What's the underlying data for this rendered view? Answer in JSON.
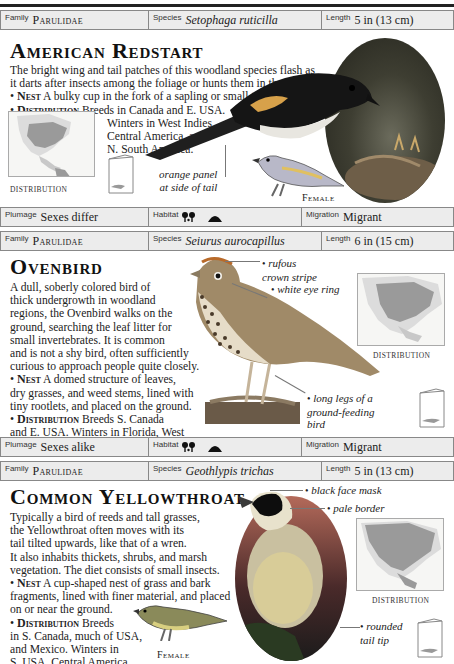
{
  "page": {
    "top_rule": true
  },
  "entries": [
    {
      "id": "american-redstart",
      "info_bar": {
        "family_label": "Family",
        "family": "Parulidae",
        "species_label": "Species",
        "species": "Setophaga ruticilla",
        "length_label": "Length",
        "length": "5 in (13 cm)"
      },
      "title": "American Redstart",
      "description": "The bright wing and tail patches of this woodland species flash as it darts after insects among the foliage or hunts them in the air.",
      "nest_label": "Nest",
      "nest": "A bulky cup in the fork of a sapling or small tree.",
      "distribution_label": "Distribution",
      "distribution": "Breeds in Canada and E. USA.",
      "distribution_cont": [
        "Winters in West Indies,",
        "Central America, and",
        "N. South America."
      ],
      "map_caption": "DISTRIBUTION",
      "callouts": [
        "orange panel at side of tail"
      ],
      "callout_lines": [
        "orange panel",
        "at side of tail"
      ],
      "female_label": "Female",
      "status_bar": {
        "plumage_label": "Plumage",
        "plumage": "Sexes differ",
        "habitat_label": "Habitat",
        "habitat_icons": [
          "trees-icon",
          "hill-icon"
        ],
        "migration_label": "Migration",
        "migration": "Migrant"
      }
    },
    {
      "id": "ovenbird",
      "info_bar": {
        "family_label": "Family",
        "family": "Parulidae",
        "species_label": "Species",
        "species": "Seiurus aurocapillus",
        "length_label": "Length",
        "length": "6 in (15 cm)"
      },
      "title": "Ovenbird",
      "description_lines": [
        "A dull, soberly colored bird of",
        "thick undergrowth in woodland",
        "regions, the Ovenbird walks on the",
        "ground, searching the leaf litter for",
        "small invertebrates. It is common",
        "and is not a shy bird, often sufficiently",
        "curious to approach people quite closely."
      ],
      "nest_label": "Nest",
      "nest_lines": [
        "A domed structure of leaves,",
        "dry grasses, and weed stems, lined with",
        "tiny rootlets, and placed on the ground."
      ],
      "distribution_label": "Distribution",
      "distribution_lines": [
        "Breeds S. Canada",
        "and E. USA. Winters in Florida, West",
        "Indies, and south to N.W. South America."
      ],
      "map_caption": "DISTRIBUTION",
      "callouts": [
        {
          "lines": [
            "rufous",
            "crown stripe"
          ]
        },
        {
          "lines": [
            "white eye ring"
          ]
        },
        {
          "lines": [
            "long legs of a",
            "ground-feeding",
            "bird"
          ]
        }
      ],
      "status_bar": {
        "plumage_label": "Plumage",
        "plumage": "Sexes alike",
        "habitat_label": "Habitat",
        "habitat_icons": [
          "trees-icon",
          "hill-icon"
        ],
        "migration_label": "Migration",
        "migration": "Migrant"
      }
    },
    {
      "id": "common-yellowthroat",
      "info_bar": {
        "family_label": "Family",
        "family": "Parulidae",
        "species_label": "Species",
        "species": "Geothlypis trichas",
        "length_label": "Length",
        "length": "5 in (13 cm)"
      },
      "title": "Common Yellowthroat",
      "description_lines": [
        "Typically a bird of reeds and tall grasses,",
        "the Yellowthroat often moves with its",
        "tail tilted upwards, like that of a wren.",
        "It also inhabits thickets, shrubs, and marsh",
        "vegetation. The diet consists of small insects."
      ],
      "nest_label": "Nest",
      "nest_lines": [
        "A cup-shaped nest of grass and bark",
        "fragments, lined with finer material, and placed",
        "on or near the ground."
      ],
      "distribution_label": "Distribution",
      "distribution_lines": [
        "Breeds",
        "in S. Canada, much of USA,",
        "and Mexico. Winters in",
        "S. USA, Central America,",
        "Colombia, and Venezuela."
      ],
      "map_caption": "DISTRIBUTION",
      "female_label": "Female",
      "callouts": [
        {
          "lines": [
            "black face mask"
          ]
        },
        {
          "lines": [
            "pale border"
          ]
        },
        {
          "lines": [
            "rounded",
            "tail tip"
          ]
        }
      ]
    }
  ]
}
